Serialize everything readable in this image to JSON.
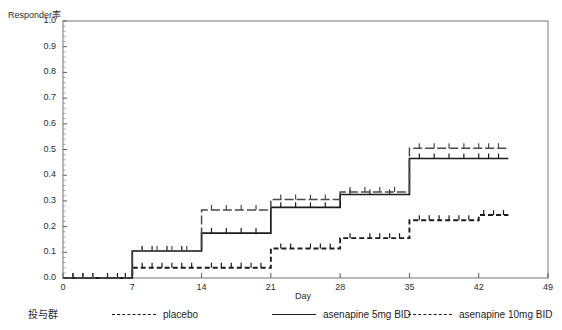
{
  "chart_data": {
    "type": "line",
    "subtype": "kaplan-meier-step",
    "title": "",
    "xlabel": "Day",
    "ylabel": "Responder率",
    "xlim": [
      0,
      49
    ],
    "ylim": [
      0.0,
      1.0
    ],
    "grid": false,
    "x_ticks": [
      "0",
      "7",
      "14",
      "21",
      "28",
      "35",
      "42",
      "49"
    ],
    "x_tick_values": [
      0,
      7,
      14,
      21,
      28,
      35,
      42,
      49
    ],
    "y_ticks": [
      "0.0",
      "0.1",
      "0.2",
      "0.3",
      "0.4",
      "0.5",
      "0.6",
      "0.7",
      "0.8",
      "0.9",
      "1.0"
    ],
    "y_tick_values": [
      0.0,
      0.1,
      0.2,
      0.3,
      0.4,
      0.5,
      0.6,
      0.7,
      0.8,
      0.9,
      1.0
    ],
    "legend_position": "bottom",
    "legend_title": "投与群",
    "series": [
      {
        "name": "placebo",
        "style": "dotted",
        "color": "#1c1c1c",
        "x": [
          0,
          4,
          7,
          14,
          21,
          28,
          35,
          42,
          45
        ],
        "values": [
          0.0,
          0.0,
          0.04,
          0.04,
          0.115,
          0.155,
          0.225,
          0.245,
          0.245
        ],
        "censor_x": [
          1,
          2,
          3,
          4.5,
          5.5,
          6.3,
          8,
          9,
          10,
          11,
          12,
          13,
          15,
          16,
          17,
          18,
          19,
          20,
          22,
          23,
          25,
          26,
          27,
          29,
          31,
          32,
          33,
          34,
          36,
          37,
          38,
          39,
          40,
          41,
          42.5,
          43.5,
          44.5
        ]
      },
      {
        "name": "asenapine 5mg BID",
        "style": "solid",
        "color": "#1c1c1c",
        "x": [
          0,
          4,
          7,
          14,
          21,
          28,
          35,
          42,
          45
        ],
        "values": [
          0.0,
          0.0,
          0.105,
          0.175,
          0.275,
          0.325,
          0.465,
          0.465,
          0.465
        ],
        "censor_x": [
          1,
          2,
          3,
          8,
          9,
          10.5,
          12,
          15,
          16.5,
          18,
          19.5,
          22,
          23.5,
          25,
          26.5,
          29,
          31,
          33,
          36,
          37.5,
          39,
          40.5,
          42,
          43,
          44
        ]
      },
      {
        "name": "asenapine 10mg BID",
        "style": "dash-dot",
        "color": "#4a4a4a",
        "x": [
          0,
          4,
          7,
          14,
          21,
          28,
          35,
          42,
          45
        ],
        "values": [
          0.0,
          0.0,
          0.105,
          0.265,
          0.305,
          0.335,
          0.505,
          0.505,
          0.505
        ],
        "censor_x": [
          1,
          2,
          3,
          8,
          9.5,
          11,
          12.5,
          15,
          16.5,
          18,
          19.5,
          22,
          23.5,
          25,
          26.5,
          29,
          30.5,
          32,
          33.5,
          36,
          37.5,
          39,
          40.5,
          42,
          43,
          44
        ]
      }
    ]
  },
  "legend": {
    "title": "投与群",
    "entries": [
      {
        "label": "placebo",
        "style": "placebo"
      },
      {
        "label": "asenapine 5mg BID",
        "style": "5mg"
      },
      {
        "label": "asenapine 10mg BID",
        "style": "10mg"
      }
    ]
  }
}
